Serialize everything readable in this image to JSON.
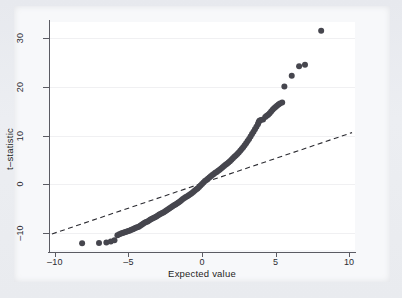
{
  "figure": {
    "background_color": "#e9ebef",
    "panel_color": "#ffffff",
    "marker_color": "#46464e",
    "axis_color": "#5b5b63",
    "gridline_color": "#f0f0f2"
  },
  "axes": {
    "xlabel": "Expected value",
    "ylabel": "t–statistic",
    "xticks": [
      "-10",
      "-5",
      "0",
      "5",
      "10"
    ],
    "xtick_values": [
      -10,
      -5,
      0,
      5,
      10
    ],
    "yticks": [
      "-10",
      "0",
      "10",
      "20",
      "30"
    ],
    "ytick_values": [
      -10,
      0,
      10,
      20,
      30
    ],
    "xlim": [
      -10.4,
      10.4
    ],
    "ylim": [
      -13.6,
      33.4
    ]
  },
  "chart_data": {
    "type": "scatter",
    "title": "",
    "subtitle": "",
    "xlabel": "Expected value",
    "ylabel": "t–statistic",
    "xlim": [
      -10.4,
      10.4
    ],
    "ylim": [
      -13.6,
      33.4
    ],
    "xticks": [
      -10,
      -5,
      0,
      5,
      10
    ],
    "yticks": [
      -10,
      0,
      10,
      20,
      30
    ],
    "grid": "horizontal",
    "legend": "none",
    "marker_color": "#46464e",
    "marker_size": 3.0,
    "series": [
      {
        "name": "t-statistic quantiles",
        "type": "scatter",
        "points": [
          [
            -8.15,
            -12.2
          ],
          [
            -7.0,
            -12.15
          ],
          [
            -6.5,
            -12.05
          ],
          [
            -6.2,
            -11.85
          ],
          [
            -5.95,
            -11.6
          ],
          [
            -5.75,
            -10.55
          ],
          [
            -5.62,
            -10.35
          ],
          [
            -5.5,
            -10.2
          ],
          [
            -5.4,
            -10.1
          ],
          [
            -5.3,
            -10.0
          ],
          [
            -5.2,
            -9.9
          ],
          [
            -5.1,
            -9.8
          ],
          [
            -5.0,
            -9.7
          ],
          [
            -4.9,
            -9.58
          ],
          [
            -4.8,
            -9.45
          ],
          [
            -4.7,
            -9.3
          ],
          [
            -4.6,
            -9.15
          ],
          [
            -4.5,
            -9.0
          ],
          [
            -4.4,
            -8.9
          ],
          [
            -4.3,
            -8.8
          ],
          [
            -4.2,
            -8.6
          ],
          [
            -4.1,
            -8.4
          ],
          [
            -4.0,
            -8.2
          ],
          [
            -3.9,
            -8.0
          ],
          [
            -3.8,
            -7.85
          ],
          [
            -3.7,
            -7.7
          ],
          [
            -3.6,
            -7.5
          ],
          [
            -3.5,
            -7.3
          ],
          [
            -3.4,
            -7.15
          ],
          [
            -3.3,
            -7.0
          ],
          [
            -3.2,
            -6.85
          ],
          [
            -3.1,
            -6.7
          ],
          [
            -3.0,
            -6.5
          ],
          [
            -2.9,
            -6.3
          ],
          [
            -2.8,
            -6.15
          ],
          [
            -2.7,
            -5.95
          ],
          [
            -2.6,
            -5.8
          ],
          [
            -2.5,
            -5.6
          ],
          [
            -2.4,
            -5.4
          ],
          [
            -2.3,
            -5.2
          ],
          [
            -2.2,
            -5.0
          ],
          [
            -2.1,
            -4.8
          ],
          [
            -2.0,
            -4.6
          ],
          [
            -1.9,
            -4.4
          ],
          [
            -1.8,
            -4.2
          ],
          [
            -1.7,
            -4.0
          ],
          [
            -1.6,
            -3.8
          ],
          [
            -1.5,
            -3.6
          ],
          [
            -1.4,
            -3.35
          ],
          [
            -1.3,
            -3.1
          ],
          [
            -1.2,
            -2.9
          ],
          [
            -1.1,
            -2.7
          ],
          [
            -1.0,
            -2.5
          ],
          [
            -0.9,
            -2.3
          ],
          [
            -0.8,
            -2.1
          ],
          [
            -0.7,
            -1.9
          ],
          [
            -0.6,
            -1.65
          ],
          [
            -0.5,
            -1.4
          ],
          [
            -0.4,
            -1.15
          ],
          [
            -0.3,
            -0.9
          ],
          [
            -0.2,
            -0.6
          ],
          [
            -0.1,
            -0.3
          ],
          [
            0.0,
            0.0
          ],
          [
            0.1,
            0.3
          ],
          [
            0.2,
            0.6
          ],
          [
            0.3,
            0.85
          ],
          [
            0.4,
            1.1
          ],
          [
            0.5,
            1.35
          ],
          [
            0.6,
            1.6
          ],
          [
            0.7,
            1.85
          ],
          [
            0.8,
            2.05
          ],
          [
            0.9,
            2.3
          ],
          [
            1.0,
            2.5
          ],
          [
            1.1,
            2.75
          ],
          [
            1.2,
            2.95
          ],
          [
            1.3,
            3.2
          ],
          [
            1.4,
            3.45
          ],
          [
            1.5,
            3.7
          ],
          [
            1.6,
            3.95
          ],
          [
            1.7,
            4.2
          ],
          [
            1.8,
            4.45
          ],
          [
            1.9,
            4.7
          ],
          [
            2.0,
            5.0
          ],
          [
            2.1,
            5.3
          ],
          [
            2.2,
            5.6
          ],
          [
            2.3,
            5.9
          ],
          [
            2.4,
            6.2
          ],
          [
            2.5,
            6.5
          ],
          [
            2.6,
            6.85
          ],
          [
            2.7,
            7.2
          ],
          [
            2.8,
            7.6
          ],
          [
            2.9,
            8.0
          ],
          [
            3.0,
            8.4
          ],
          [
            3.1,
            8.85
          ],
          [
            3.2,
            9.3
          ],
          [
            3.3,
            9.8
          ],
          [
            3.4,
            10.3
          ],
          [
            3.5,
            10.8
          ],
          [
            3.6,
            11.3
          ],
          [
            3.7,
            11.8
          ],
          [
            3.8,
            12.3
          ],
          [
            3.85,
            12.75
          ],
          [
            3.9,
            13.05
          ],
          [
            4.0,
            13.2
          ],
          [
            4.15,
            13.3
          ],
          [
            4.3,
            13.8
          ],
          [
            4.4,
            14.1
          ],
          [
            4.5,
            14.3
          ],
          [
            4.6,
            14.6
          ],
          [
            4.7,
            14.95
          ],
          [
            4.8,
            15.3
          ],
          [
            4.9,
            15.6
          ],
          [
            5.0,
            15.9
          ],
          [
            5.1,
            16.15
          ],
          [
            5.2,
            16.4
          ],
          [
            5.3,
            16.6
          ],
          [
            5.45,
            16.8
          ],
          [
            5.6,
            20.1
          ],
          [
            6.1,
            22.3
          ],
          [
            6.6,
            24.3
          ],
          [
            7.0,
            24.6
          ],
          [
            8.1,
            31.6
          ]
        ]
      },
      {
        "name": "reference line",
        "type": "line",
        "style": "dashed",
        "color": "#2b2b31",
        "points": [
          [
            -10.2,
            -10.3
          ],
          [
            10.2,
            10.6
          ]
        ]
      }
    ]
  }
}
